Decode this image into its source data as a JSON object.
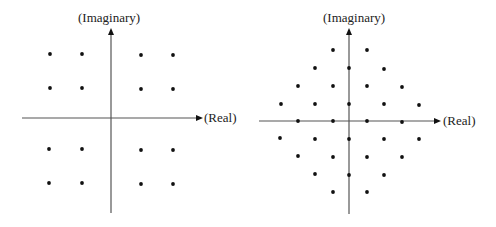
{
  "colors": {
    "axis": "#555555",
    "dot": "#111111",
    "text": "#222222",
    "background": "#ffffff"
  },
  "diagrams": [
    {
      "name": "16-QAM square constellation",
      "axis": {
        "origin": [
          111,
          118
        ],
        "x_start": 22,
        "x_end": 203,
        "y_top": 28,
        "y_bottom": 213,
        "x_label": "(Real)",
        "y_label": "(Imaginary)",
        "x_label_pos": [
          204,
          111
        ],
        "y_label_pos": [
          78,
          11
        ]
      },
      "points": [
        [
          50,
          54
        ],
        [
          82,
          54
        ],
        [
          141,
          55
        ],
        [
          173,
          55
        ],
        [
          50,
          88
        ],
        [
          82,
          88
        ],
        [
          141,
          89
        ],
        [
          173,
          89
        ],
        [
          49,
          149
        ],
        [
          82,
          149
        ],
        [
          141,
          150
        ],
        [
          173,
          150
        ],
        [
          49,
          183
        ],
        [
          82,
          183
        ],
        [
          141,
          184
        ],
        [
          173,
          184
        ]
      ]
    },
    {
      "name": "32-point cross/diamond constellation",
      "axis": {
        "origin": [
          349,
          121
        ],
        "x_start": 259,
        "x_end": 441,
        "y_top": 28,
        "y_bottom": 214,
        "x_label": "(Real)",
        "y_label": "(Imaginary)",
        "x_label_pos": [
          443,
          114
        ],
        "y_label_pos": [
          323,
          11
        ]
      },
      "points": [
        [
          333,
          50
        ],
        [
          367,
          50
        ],
        [
          315,
          68
        ],
        [
          349,
          68
        ],
        [
          384,
          69
        ],
        [
          298,
          86
        ],
        [
          333,
          86
        ],
        [
          367,
          86
        ],
        [
          402,
          87
        ],
        [
          281,
          104
        ],
        [
          315,
          104
        ],
        [
          349,
          104
        ],
        [
          384,
          104
        ],
        [
          419,
          105
        ],
        [
          298,
          121
        ],
        [
          333,
          121
        ],
        [
          367,
          121
        ],
        [
          402,
          122
        ],
        [
          280,
          138
        ],
        [
          315,
          139
        ],
        [
          349,
          139
        ],
        [
          384,
          139
        ],
        [
          419,
          139
        ],
        [
          298,
          156
        ],
        [
          333,
          157
        ],
        [
          367,
          157
        ],
        [
          402,
          157
        ],
        [
          315,
          174
        ],
        [
          349,
          175
        ],
        [
          384,
          175
        ],
        [
          333,
          192
        ],
        [
          367,
          192
        ]
      ]
    }
  ]
}
